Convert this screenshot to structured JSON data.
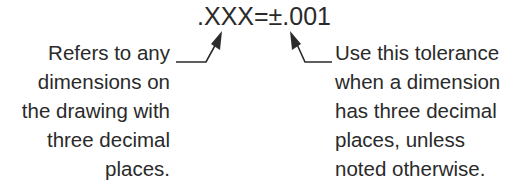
{
  "title": ".XXX=±.001",
  "left_note": {
    "lines": [
      "Refers to any",
      "dimensions on",
      "the drawing with",
      "three decimal",
      "places."
    ]
  },
  "right_note": {
    "lines": [
      "Use this tolerance",
      "when a dimension",
      "has three decimal",
      "places, unless",
      "noted otherwise."
    ]
  },
  "colors": {
    "text": "#2a2a2a",
    "leader": "#2a2a2a",
    "background": "#ffffff"
  }
}
